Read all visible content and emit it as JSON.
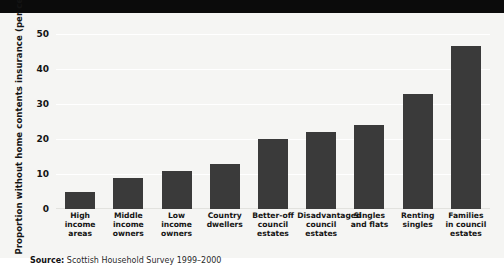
{
  "chart_data": {
    "type": "bar",
    "title": "",
    "xlabel": "",
    "ylabel": "Proportion without home contents insurance (per cent)",
    "ylim": [
      0,
      52
    ],
    "yticks": [
      0,
      10,
      20,
      30,
      40,
      50
    ],
    "grid": true,
    "legend": null,
    "bar_color": "#3a3a3a",
    "categories": [
      "High\nincome\nareas",
      "Middle\nincome\nowners",
      "Low income\nowners",
      "Country\ndwellers",
      "Better-off\ncouncil\nestates",
      "Disadvantaged\ncouncil\nestates",
      "Singles\nand flats",
      "Renting\nsingles",
      "Families\nin council\nestates"
    ],
    "values": [
      5,
      9,
      11,
      13,
      20,
      22,
      24,
      33,
      46.5
    ]
  },
  "axis": {
    "y_title": "Proportion without home contents insurance (per cent)",
    "tick_labels": [
      "50",
      "40",
      "30",
      "20",
      "10",
      "0"
    ]
  },
  "source": {
    "label": "Source:",
    "text": " Scottish Household Survey 1999–2000"
  },
  "colors": {
    "background": "#f5f5f3",
    "bar": "#3a3a3a",
    "gridline": "#ffffff",
    "band": "#0b0b0b",
    "text": "#141414"
  }
}
